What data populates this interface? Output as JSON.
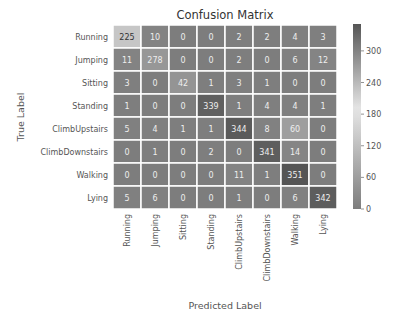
{
  "chart_data": {
    "type": "heatmap",
    "title": "Confusion Matrix",
    "xlabel": "Predicted Label",
    "ylabel": "True Label",
    "row_labels": [
      "Running",
      "Jumping",
      "Sitting",
      "Standing",
      "ClimbUpstairs",
      "ClimbDownstairs",
      "Walking",
      "Lying"
    ],
    "col_labels": [
      "Running",
      "Jumping",
      "Sitting",
      "Standing",
      "ClimbUpstairs",
      "ClimbDownstairs",
      "Walking",
      "Lying"
    ],
    "values": [
      [
        225,
        10,
        0,
        0,
        2,
        2,
        4,
        3
      ],
      [
        11,
        278,
        0,
        0,
        2,
        0,
        6,
        12
      ],
      [
        3,
        0,
        42,
        1,
        3,
        1,
        0,
        0
      ],
      [
        1,
        0,
        0,
        339,
        1,
        4,
        4,
        1
      ],
      [
        5,
        4,
        1,
        1,
        344,
        8,
        60,
        0
      ],
      [
        0,
        1,
        0,
        2,
        0,
        341,
        14,
        0
      ],
      [
        0,
        0,
        0,
        0,
        11,
        1,
        351,
        0
      ],
      [
        5,
        6,
        0,
        0,
        1,
        0,
        6,
        342
      ]
    ],
    "colorbar": {
      "ticks": [
        0,
        60,
        120,
        180,
        240,
        300
      ],
      "range": [
        0,
        351
      ]
    },
    "colormap_stops": [
      {
        "value": 0,
        "color": "#7d7d7d"
      },
      {
        "value": 190,
        "color": "#e6e6e6"
      },
      {
        "value": 351,
        "color": "#555555"
      }
    ]
  }
}
